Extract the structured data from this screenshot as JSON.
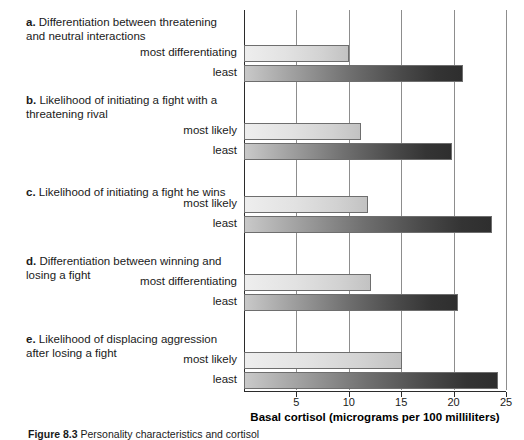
{
  "figure": {
    "caption_label": "Figure 8.3",
    "caption_text": "Personality characteristics and cortisol"
  },
  "axis": {
    "title": "Basal cortisol (micrograms per 100 milliliters)",
    "ticks": [
      "5",
      "10",
      "15",
      "20",
      "25"
    ],
    "min": 0,
    "max": 25
  },
  "groups": [
    {
      "letter": "a.",
      "heading": "Differentiation between threatening and neutral interactions",
      "bars": [
        {
          "label": "most differentiating",
          "value": 10.0,
          "style": "light"
        },
        {
          "label": "least",
          "value": 20.9,
          "style": "dark"
        }
      ]
    },
    {
      "letter": "b.",
      "heading": "Likelihood of initiating a fight with a threatening rival",
      "bars": [
        {
          "label": "most likely",
          "value": 11.2,
          "style": "light"
        },
        {
          "label": "least",
          "value": 19.8,
          "style": "dark"
        }
      ]
    },
    {
      "letter": "c.",
      "heading": "Likelihood of initiating a fight he wins",
      "bars": [
        {
          "label": "most likely",
          "value": 11.8,
          "style": "light"
        },
        {
          "label": "least",
          "value": 23.7,
          "style": "dark"
        }
      ]
    },
    {
      "letter": "d.",
      "heading": "Differentiation between winning and losing a fight",
      "bars": [
        {
          "label": "most differentiating",
          "value": 12.1,
          "style": "light"
        },
        {
          "label": "least",
          "value": 20.4,
          "style": "dark"
        }
      ]
    },
    {
      "letter": "e.",
      "heading": "Likelihood of displacing aggression after losing a fight",
      "bars": [
        {
          "label": "most likely",
          "value": 15.1,
          "style": "light"
        },
        {
          "label": "least",
          "value": 24.2,
          "style": "dark"
        }
      ]
    }
  ],
  "chart_data": {
    "type": "bar",
    "orientation": "horizontal",
    "title": "",
    "xlabel": "Basal cortisol (micrograms per 100 milliliters)",
    "ylabel": "",
    "xlim": [
      0,
      25
    ],
    "xticks": [
      5,
      10,
      15,
      20,
      25
    ],
    "grid": "vertical",
    "legend": "none",
    "categories": [
      "a. most differentiating",
      "a. least",
      "b. most likely",
      "b. least",
      "c. most likely",
      "c. least",
      "d. most differentiating",
      "d. least",
      "e. most likely",
      "e. least"
    ],
    "values": [
      10.0,
      20.9,
      11.2,
      19.8,
      11.8,
      23.7,
      12.1,
      20.4,
      15.1,
      24.2
    ],
    "panels": [
      {
        "id": "a",
        "label": "Differentiation between threatening and neutral interactions",
        "categories": [
          "most differentiating",
          "least"
        ],
        "values": [
          10.0,
          20.9
        ]
      },
      {
        "id": "b",
        "label": "Likelihood of initiating a fight with a threatening rival",
        "categories": [
          "most likely",
          "least"
        ],
        "values": [
          11.2,
          19.8
        ]
      },
      {
        "id": "c",
        "label": "Likelihood of initiating a fight he wins",
        "categories": [
          "most likely",
          "least"
        ],
        "values": [
          11.8,
          23.7
        ]
      },
      {
        "id": "d",
        "label": "Differentiation between winning and losing a fight",
        "categories": [
          "most differentiating",
          "least"
        ],
        "values": [
          12.1,
          20.4
        ]
      },
      {
        "id": "e",
        "label": "Likelihood of displacing aggression after losing a fight",
        "categories": [
          "most likely",
          "least"
        ],
        "values": [
          15.1,
          24.2
        ]
      }
    ]
  },
  "layout": {
    "group_heading_tops": [
      16,
      94,
      186,
      255,
      333
    ],
    "bar_tops": [
      45,
      65,
      123,
      143,
      196,
      216,
      274,
      294,
      352,
      372
    ],
    "label_tops": [
      46,
      66,
      124,
      144,
      197,
      217,
      275,
      295,
      353,
      373
    ]
  }
}
